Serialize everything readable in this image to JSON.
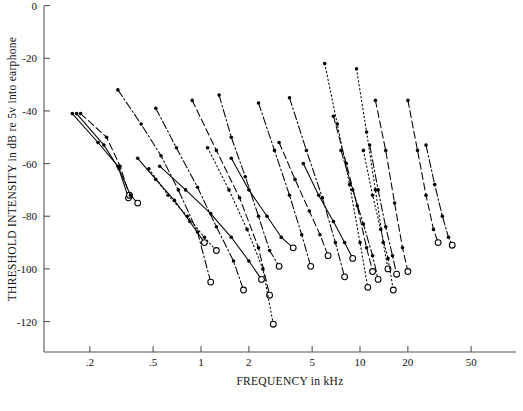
{
  "chart_data": {
    "type": "line",
    "title": "",
    "xlabel": "FREQUENCY in kHz",
    "ylabel": "THRESHOLD INTENSITY in dB re 5v into earphone",
    "xscale": "log",
    "xlim": [
      0.13,
      70
    ],
    "ylim": [
      -130,
      0
    ],
    "grid": false,
    "legend": null,
    "xticks": [
      0.2,
      0.5,
      1,
      2,
      5,
      10,
      20,
      50
    ],
    "xticklabels": [
      ".2",
      ".5",
      "1",
      "2",
      "5",
      "10",
      "20",
      "50"
    ],
    "yticks": [
      0,
      -20,
      -40,
      -60,
      -80,
      -100,
      -120
    ],
    "yticklabels": [
      "0",
      "-20",
      "-40",
      "-60",
      "-80",
      "-100",
      "-120"
    ],
    "marker": "filled-circle",
    "tip_marker": "open-circle",
    "series": [
      {
        "name": "unit-01",
        "dash": "solid",
        "x": [
          0.155,
          0.225,
          0.3,
          0.35
        ],
        "y": [
          -41,
          -52,
          -61,
          -73
        ],
        "tip_index": 3
      },
      {
        "name": "unit-02",
        "dash": "dashed",
        "x": [
          0.175,
          0.255,
          0.31,
          0.355
        ],
        "y": [
          -41,
          -50,
          -61,
          -72
        ],
        "tip_index": 3
      },
      {
        "name": "unit-03",
        "dash": "solid",
        "x": [
          0.165,
          0.245,
          0.305,
          0.36,
          0.4
        ],
        "y": [
          -41,
          -53,
          -62,
          -72,
          -75
        ],
        "tip_index": 4
      },
      {
        "name": "unit-04",
        "dash": "dashdot",
        "x": [
          0.3,
          0.42,
          0.56,
          0.72,
          0.95,
          1.15
        ],
        "y": [
          -32,
          -45,
          -57,
          -70,
          -86,
          -105
        ],
        "tip_index": 5
      },
      {
        "name": "unit-05",
        "dash": "solid",
        "x": [
          0.4,
          0.52,
          0.68,
          0.85,
          1.05
        ],
        "y": [
          -58,
          -66,
          -74,
          -82,
          -90
        ],
        "tip_index": 4
      },
      {
        "name": "unit-06",
        "dash": "dotted",
        "x": [
          0.47,
          0.62,
          0.82,
          1.05,
          1.25
        ],
        "y": [
          -62,
          -72,
          -80,
          -88,
          -93
        ],
        "tip_index": 4
      },
      {
        "name": "unit-07",
        "dash": "dashdot",
        "x": [
          0.52,
          0.7,
          0.95,
          1.25,
          1.6,
          1.85
        ],
        "y": [
          -39,
          -54,
          -69,
          -84,
          -97,
          -108
        ],
        "tip_index": 5
      },
      {
        "name": "unit-08",
        "dash": "solid",
        "x": [
          0.55,
          0.8,
          1.15,
          1.55,
          2.0,
          2.4
        ],
        "y": [
          -61,
          -70,
          -79,
          -88,
          -97,
          -104
        ],
        "tip_index": 5
      },
      {
        "name": "unit-09",
        "dash": "dashed",
        "x": [
          0.88,
          1.25,
          1.75,
          2.3,
          2.7
        ],
        "y": [
          -36,
          -55,
          -73,
          -92,
          -110
        ],
        "tip_index": 4
      },
      {
        "name": "unit-10",
        "dash": "dotted",
        "x": [
          1.1,
          1.5,
          1.95,
          2.45,
          2.85
        ],
        "y": [
          -54,
          -70,
          -85,
          -100,
          -121
        ],
        "tip_index": 4
      },
      {
        "name": "unit-11",
        "dash": "dashdot",
        "x": [
          1.3,
          1.55,
          1.9,
          2.3,
          2.7,
          3.1
        ],
        "y": [
          -34,
          -50,
          -65,
          -80,
          -93,
          -99
        ],
        "tip_index": 5
      },
      {
        "name": "unit-12",
        "dash": "solid",
        "x": [
          1.55,
          2.0,
          2.6,
          3.2,
          3.8
        ],
        "y": [
          -58,
          -70,
          -80,
          -88,
          -92
        ],
        "tip_index": 4
      },
      {
        "name": "unit-13",
        "dash": "dashdot",
        "x": [
          2.3,
          2.9,
          3.6,
          4.3,
          4.9
        ],
        "y": [
          -37,
          -55,
          -72,
          -87,
          -99
        ],
        "tip_index": 4
      },
      {
        "name": "unit-14",
        "dash": "dashed",
        "x": [
          3.1,
          3.9,
          4.8,
          5.6,
          6.3
        ],
        "y": [
          -52,
          -66,
          -78,
          -87,
          -95
        ],
        "tip_index": 4
      },
      {
        "name": "unit-15",
        "dash": "dashdot",
        "x": [
          3.6,
          4.6,
          5.8,
          7.0,
          8.0
        ],
        "y": [
          -35,
          -55,
          -73,
          -90,
          -103
        ],
        "tip_index": 4
      },
      {
        "name": "unit-16",
        "dash": "solid",
        "x": [
          4.4,
          5.5,
          6.8,
          8.0,
          9.0
        ],
        "y": [
          -60,
          -72,
          -82,
          -90,
          -96
        ],
        "tip_index": 4
      },
      {
        "name": "unit-17",
        "dash": "dotted",
        "x": [
          6.0,
          7.2,
          8.6,
          10.0,
          11.2
        ],
        "y": [
          -22,
          -45,
          -68,
          -90,
          -107
        ],
        "tip_index": 4
      },
      {
        "name": "unit-18",
        "dash": "dashed",
        "x": [
          6.8,
          8.2,
          9.6,
          11.0,
          12.0
        ],
        "y": [
          -42,
          -60,
          -76,
          -92,
          -101
        ],
        "tip_index": 4
      },
      {
        "name": "unit-19",
        "dash": "dashdot",
        "x": [
          7.6,
          9.0,
          10.5,
          12.0,
          13.0
        ],
        "y": [
          -55,
          -70,
          -83,
          -95,
          -104
        ],
        "tip_index": 4
      },
      {
        "name": "unit-20",
        "dash": "dotted",
        "x": [
          9.5,
          11.0,
          12.5,
          14.0,
          15.0
        ],
        "y": [
          -24,
          -48,
          -70,
          -90,
          -100
        ],
        "tip_index": 4
      },
      {
        "name": "unit-21",
        "dash": "dotted",
        "x": [
          10.5,
          12.0,
          13.5,
          15.0,
          16.2
        ],
        "y": [
          -55,
          -72,
          -85,
          -96,
          -108
        ],
        "tip_index": 4
      },
      {
        "name": "unit-22",
        "dash": "dashdot",
        "x": [
          11.5,
          13.0,
          14.5,
          16.0,
          17.0
        ],
        "y": [
          -53,
          -70,
          -84,
          -95,
          -102
        ],
        "tip_index": 4
      },
      {
        "name": "unit-23",
        "dash": "dashed",
        "x": [
          12.5,
          14.5,
          16.5,
          18.5,
          20.0
        ],
        "y": [
          -36,
          -55,
          -75,
          -92,
          -101
        ],
        "tip_index": 4
      },
      {
        "name": "unit-24",
        "dash": "dashed",
        "x": [
          20.0,
          23.0,
          26.0,
          29.0,
          31.0
        ],
        "y": [
          -36,
          -55,
          -72,
          -85,
          -90
        ],
        "tip_index": 4
      },
      {
        "name": "unit-25",
        "dash": "dashdot",
        "x": [
          26.0,
          29.5,
          33.0,
          36.0,
          38.0
        ],
        "y": [
          -53,
          -68,
          -80,
          -88,
          -91
        ],
        "tip_index": 4
      }
    ]
  }
}
